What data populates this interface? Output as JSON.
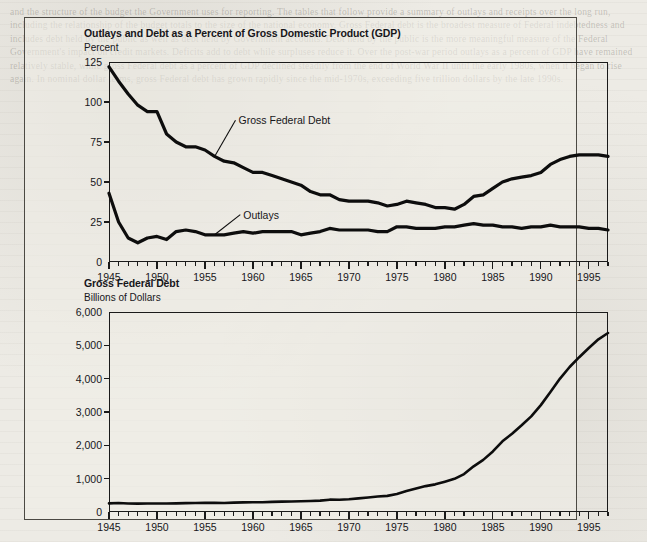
{
  "page": {
    "background_color": "#edebe5",
    "ghost_text": "and the structure of the budget the Government uses for reporting. The tables that follow provide a summary of outlays and receipts over the long run, including the relationship of the budget totals to the size of the national economy. Gross Federal debt is the broadest measure of Federal indebtedness and includes debt held by the public as well as debt held by Government accounts. Debt held by the public is the more meaningful measure of the Federal Government's impact on credit markets. Deficits add to debt while surpluses reduce it. Over the post-war period outlays as a percent of GDP have remained relatively stable, while gross Federal debt as a percent of GDP declined steadily from the end of World War II until the early 1980s, when it began to rise again. In nominal dollar terms, gross Federal debt has grown rapidly since the mid-1970s, exceeding five trillion dollars by the late 1990s."
  },
  "charts": [
    {
      "id": "outlays-and-debt-pct-gdp",
      "chart_data": {
        "type": "line",
        "title": "Outlays and Debt as a Percent of Gross Domestic Product (GDP)",
        "subtitle": "Percent",
        "xlabel": "",
        "ylabel": "Percent",
        "xlim": [
          1945,
          1997
        ],
        "ylim": [
          0,
          125
        ],
        "yticks": [
          0,
          25,
          50,
          75,
          100,
          125
        ],
        "ytick_labels": [
          "0",
          "25",
          "50",
          "75",
          "100",
          "125"
        ],
        "xticks": [
          1945,
          1950,
          1955,
          1960,
          1965,
          1970,
          1975,
          1980,
          1985,
          1990,
          1995
        ],
        "xtick_labels": [
          "1945",
          "1950",
          "1955",
          "1960",
          "1965",
          "1970",
          "1975",
          "1980",
          "1985",
          "1990",
          "1995"
        ],
        "minor_xtick_interval": 1,
        "grid": false,
        "legend": "inline-annotations",
        "annotations": [
          {
            "text": "Gross Federal Debt",
            "x": 1958.5,
            "y": 88
          },
          {
            "text": "Outlays",
            "x": 1959.0,
            "y": 29
          }
        ],
        "x": [
          1945,
          1946,
          1947,
          1948,
          1949,
          1950,
          1951,
          1952,
          1953,
          1954,
          1955,
          1956,
          1957,
          1958,
          1959,
          1960,
          1961,
          1962,
          1963,
          1964,
          1965,
          1966,
          1967,
          1968,
          1969,
          1970,
          1971,
          1972,
          1973,
          1974,
          1975,
          1976,
          1977,
          1978,
          1979,
          1980,
          1981,
          1982,
          1983,
          1984,
          1985,
          1986,
          1987,
          1988,
          1989,
          1990,
          1991,
          1992,
          1993,
          1994,
          1995,
          1996,
          1997
        ],
        "series": [
          {
            "name": "Gross Federal Debt",
            "values": [
              122,
              113,
              105,
              98,
              94,
              94,
              80,
              75,
              72,
              72,
              70,
              66,
              63,
              62,
              59,
              56,
              56,
              54,
              52,
              50,
              48,
              44,
              42,
              42,
              39,
              38,
              38,
              38,
              37,
              35,
              36,
              38,
              37,
              36,
              34,
              34,
              33,
              36,
              41,
              42,
              46,
              50,
              52,
              53,
              54,
              56,
              61,
              64,
              66,
              67,
              67,
              67,
              66
            ]
          },
          {
            "name": "Outlays",
            "values": [
              43,
              25,
              15,
              12,
              15,
              16,
              14,
              19,
              20,
              19,
              17,
              17,
              17,
              18,
              19,
              18,
              19,
              19,
              19,
              19,
              17,
              18,
              19,
              21,
              20,
              20,
              20,
              20,
              19,
              19,
              22,
              22,
              21,
              21,
              21,
              22,
              22,
              23,
              24,
              23,
              23,
              22,
              22,
              21,
              22,
              22,
              23,
              22,
              22,
              22,
              21,
              21,
              20
            ]
          }
        ]
      }
    },
    {
      "id": "gross-federal-debt-dollars",
      "chart_data": {
        "type": "line",
        "title": "Gross Federal Debt",
        "subtitle": "Billions of Dollars",
        "xlabel": "",
        "ylabel": "Billions of Dollars",
        "xlim": [
          1945,
          1997
        ],
        "ylim": [
          0,
          6000
        ],
        "yticks": [
          0,
          1000,
          2000,
          3000,
          4000,
          5000,
          6000
        ],
        "ytick_labels": [
          "0",
          "1,000",
          "2,000",
          "3,000",
          "4,000",
          "5,000",
          "6,000"
        ],
        "xticks": [
          1945,
          1950,
          1955,
          1960,
          1965,
          1970,
          1975,
          1980,
          1985,
          1990,
          1995
        ],
        "xtick_labels": [
          "1945",
          "1950",
          "1955",
          "1960",
          "1965",
          "1970",
          "1975",
          "1980",
          "1985",
          "1990",
          "1995"
        ],
        "minor_xtick_interval": 1,
        "grid": false,
        "legend": "none",
        "annotations": [],
        "x": [
          1945,
          1946,
          1947,
          1948,
          1949,
          1950,
          1951,
          1952,
          1953,
          1954,
          1955,
          1956,
          1957,
          1958,
          1959,
          1960,
          1961,
          1962,
          1963,
          1964,
          1965,
          1966,
          1967,
          1968,
          1969,
          1970,
          1971,
          1972,
          1973,
          1974,
          1975,
          1976,
          1977,
          1978,
          1979,
          1980,
          1981,
          1982,
          1983,
          1984,
          1985,
          1986,
          1987,
          1988,
          1989,
          1990,
          1991,
          1992,
          1993,
          1994,
          1995,
          1996,
          1997
        ],
        "series": [
          {
            "name": "Gross Federal Debt",
            "values": [
              260,
              271,
              257,
              252,
              253,
              257,
              255,
              259,
              266,
              271,
              274,
              273,
              272,
              280,
              288,
              291,
              293,
              303,
              311,
              317,
              323,
              329,
              341,
              370,
              367,
              381,
              408,
              436,
              466,
              484,
              542,
              629,
              706,
              777,
              829,
              909,
              995,
              1137,
              1371,
              1564,
              1817,
              2120,
              2346,
              2601,
              2868,
              3206,
              3598,
              4002,
              4351,
              4644,
              4921,
              5181,
              5370
            ]
          }
        ]
      }
    }
  ]
}
